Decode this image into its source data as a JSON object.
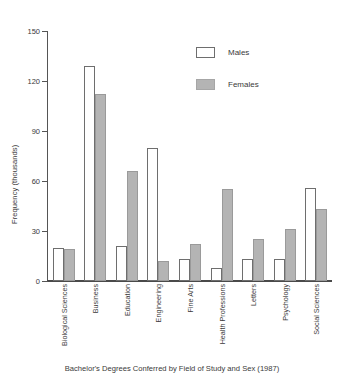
{
  "chart_data": {
    "type": "bar",
    "title": "",
    "caption": "Bachelor's Degrees Conferred by Field of Study and Sex (1987)",
    "xlabel": "",
    "ylabel": "Frequency (thousands)",
    "ylim": [
      0,
      150
    ],
    "yticks": [
      0,
      30,
      60,
      90,
      120,
      150
    ],
    "ytick_labels": [
      "0",
      "30",
      "60",
      "90",
      "120",
      "150"
    ],
    "grid": false,
    "legend_position": "upper-center",
    "categories": [
      "Biological Sciences",
      "Business",
      "Education",
      "Engineering",
      "Fine Arts",
      "Health Professions",
      "Letters",
      "Psychology",
      "Social Sciences"
    ],
    "series": [
      {
        "name": "Males",
        "color": "#ffffff",
        "edge_color": "#6e6e6e",
        "values": [
          20,
          129,
          21,
          80,
          13,
          8,
          13,
          13,
          56
        ]
      },
      {
        "name": "Females",
        "color": "#b4b4b4",
        "edge_color": "#9a9a9a",
        "values": [
          19,
          112,
          66,
          12,
          22,
          55,
          25,
          31,
          43
        ]
      }
    ]
  },
  "legend": {
    "items": [
      {
        "label": "Males"
      },
      {
        "label": "Females"
      }
    ]
  }
}
